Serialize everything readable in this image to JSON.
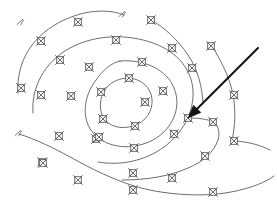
{
  "figure": {
    "background_color": "#ffffff",
    "width": 277,
    "height": 215,
    "contour_color": "#6e6e70",
    "marker_color": "#58585c",
    "annotation_color": "#121216"
  },
  "chart_data": {
    "type": "line",
    "xlabel": "",
    "ylabel": "",
    "xlim": [
      0,
      277
    ],
    "ylim": [
      0,
      215
    ],
    "grid": false,
    "legend": "none",
    "annotations": [
      {
        "name": "pointer-arrow",
        "type": "arrow",
        "from": [
          258,
          48
        ],
        "to": [
          188,
          118
        ],
        "color": "#121216",
        "label": ""
      },
      {
        "name": "top-contour-end-tick",
        "type": "tick",
        "at": [
          122,
          14
        ],
        "color": "#6e6e70"
      },
      {
        "name": "left-contour-start-tick",
        "type": "tick",
        "at": [
          18,
          133
        ],
        "color": "#6e6e70"
      },
      {
        "name": "upper-left-contour-start-tick",
        "type": "tick",
        "at": [
          20,
          22
        ],
        "color": "#6e6e70"
      }
    ],
    "series": [
      {
        "name": "contour-1-innermost",
        "closed": true,
        "path": "M 129 78 C 142 79 151 88 152 99 C 153 111 146 122 133 126 C 120 130 108 126 103 117 C 98 107 100 94 109 85 C 115 80 122 78 129 78 Z",
        "points": [
          [
            129,
            78
          ],
          [
            149,
            91
          ],
          [
            150,
            110
          ],
          [
            131,
            126
          ],
          [
            110,
            121
          ],
          [
            101,
            104
          ],
          [
            112,
            83
          ]
        ]
      },
      {
        "name": "contour-2",
        "closed": true,
        "path": "M 120 61 C 145 59 167 70 174 88 C 182 107 173 129 153 140 C 132 151 107 148 94 134 C 81 120 83 97 96 80 C 103 70 111 63 120 61 Z",
        "points": [
          [
            120,
            61
          ],
          [
            144,
            62
          ],
          [
            168,
            80
          ],
          [
            172,
            103
          ],
          [
            159,
            132
          ],
          [
            137,
            146
          ],
          [
            110,
            143
          ],
          [
            89,
            127
          ],
          [
            87,
            103
          ],
          [
            97,
            77
          ]
        ]
      },
      {
        "name": "contour-3",
        "closed": false,
        "path": "M 33 113 C 31 88 44 62 70 48 C 96 34 128 34 153 43 C 178 52 192 70 193 91 C 194 112 183 133 164 147 C 145 161 120 166 98 162",
        "points": [
          [
            33,
            113
          ],
          [
            36,
            88
          ],
          [
            57,
            59
          ],
          [
            86,
            42
          ],
          [
            117,
            38
          ],
          [
            146,
            41
          ],
          [
            175,
            58
          ],
          [
            192,
            82
          ],
          [
            190,
            110
          ],
          [
            177,
            135
          ],
          [
            156,
            153
          ],
          [
            128,
            163
          ]
        ]
      },
      {
        "name": "contour-4-outer-upper",
        "closed": false,
        "path": "M 18 93 C 16 60 34 34 64 20 C 90 8 112 10 124 15",
        "points": [
          [
            18,
            93
          ],
          [
            19,
            70
          ],
          [
            27,
            46
          ],
          [
            47,
            27
          ],
          [
            78,
            17
          ],
          [
            105,
            15
          ]
        ]
      },
      {
        "name": "contour-5-right-upper",
        "closed": false,
        "path": "M 151 20 C 164 27 178 40 188 55 C 198 70 202 86 203 103",
        "points": [
          [
            151,
            20
          ],
          [
            168,
            32
          ],
          [
            183,
            49
          ],
          [
            195,
            72
          ],
          [
            203,
            96
          ]
        ]
      },
      {
        "name": "contour-6-right-vertical",
        "closed": false,
        "path": "M 212 46 C 222 62 232 82 234 101 C 236 118 234 131 232 141 C 244 141 258 144 270 150",
        "points": [
          [
            212,
            46
          ],
          [
            224,
            66
          ],
          [
            233,
            90
          ],
          [
            233,
            120
          ],
          [
            232,
            141
          ],
          [
            252,
            145
          ],
          [
            270,
            150
          ]
        ]
      },
      {
        "name": "contour-7-pointer-branch",
        "closed": false,
        "path": "M 188 118 C 198 118 208 119 213 122 C 219 126 220 133 218 140 C 214 152 203 162 188 168 C 170 176 148 180 122 180",
        "points": [
          [
            188,
            118
          ],
          [
            205,
            119
          ],
          [
            217,
            128
          ],
          [
            216,
            145
          ],
          [
            202,
            162
          ],
          [
            178,
            173
          ],
          [
            148,
            180
          ]
        ]
      },
      {
        "name": "contour-8-lower-left",
        "closed": false,
        "path": "M 19 134 C 35 139 54 148 72 158 C 92 169 112 179 134 186 C 160 194 200 198 231 192 C 252 188 266 182 274 176",
        "points": [
          [
            19,
            134
          ],
          [
            44,
            143
          ],
          [
            72,
            158
          ],
          [
            104,
            174
          ],
          [
            134,
            186
          ],
          [
            172,
            193
          ],
          [
            210,
            194
          ],
          [
            248,
            186
          ],
          [
            274,
            176
          ]
        ]
      }
    ],
    "markers": {
      "glyph": "x-in-square",
      "size": 9,
      "count": 36,
      "positions": [
        [
          78,
          22
        ],
        [
          151,
          20
        ],
        [
          41,
          41
        ],
        [
          60,
          60
        ],
        [
          116,
          40
        ],
        [
          172,
          48
        ],
        [
          211,
          46
        ],
        [
          89,
          67
        ],
        [
          142,
          62
        ],
        [
          192,
          68
        ],
        [
          21,
          88
        ],
        [
          41,
          95
        ],
        [
          71,
          96
        ],
        [
          129,
          78
        ],
        [
          163,
          91
        ],
        [
          234,
          95
        ],
        [
          101,
          92
        ],
        [
          188,
          118
        ],
        [
          103,
          119
        ],
        [
          145,
          102
        ],
        [
          135,
          126
        ],
        [
          96,
          139
        ],
        [
          213,
          122
        ],
        [
          234,
          141
        ],
        [
          59,
          136
        ],
        [
          134,
          148
        ],
        [
          174,
          134
        ],
        [
          42,
          162
        ],
        [
          99,
          137
        ],
        [
          205,
          156
        ],
        [
          172,
          178
        ],
        [
          78,
          180
        ],
        [
          133,
          173
        ],
        [
          43,
          163
        ],
        [
          213,
          192
        ],
        [
          133,
          190
        ]
      ]
    }
  }
}
